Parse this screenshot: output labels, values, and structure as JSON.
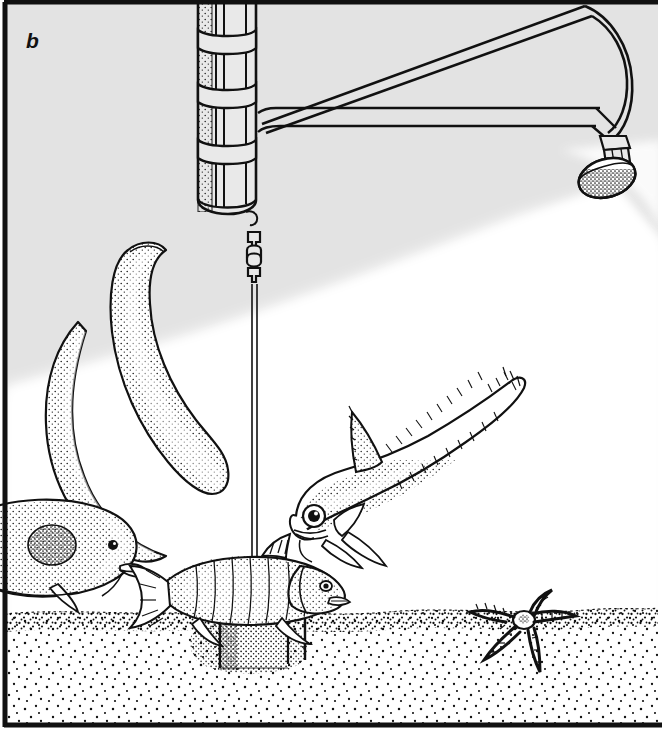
{
  "figure": {
    "panel_label": "b",
    "caption_visible": false,
    "scene_title": "Baited deep-sea camera lander on the seafloor",
    "border_color": "#000000",
    "water_color": "#e3e3e3",
    "lit_color": "#ffffff",
    "ink_color": "#000000",
    "sediment_color": "#ffffff",
    "width": 662,
    "height": 729
  },
  "scene": {
    "background": {
      "name": "water-column",
      "unlit_tone": "#e3e3e3",
      "lit_tone": "#ffffff",
      "light_cone_origin_x": 612,
      "light_cone_origin_y": 190
    },
    "sediment": {
      "name": "seafloor-sediment",
      "surface_y": 612,
      "stipple_density": "sparse",
      "surface_band_density": "dense"
    }
  },
  "equipment": {
    "buoyancy_cylinder": {
      "label": "buoyancy float cylinder",
      "x": 196,
      "y": 0,
      "width": 62,
      "height": 212,
      "band_count": 3,
      "strap_count": 3
    },
    "boom_arm": {
      "label": "lamp boom arm",
      "from_x": 258,
      "from_y": 118,
      "to_x": 600,
      "to_y": 118,
      "diagonal_to_x": 585,
      "diagonal_to_y": 105
    },
    "lamp_head": {
      "label": "underwater lamp head",
      "cx": 607,
      "cy": 178,
      "rx": 29,
      "ry": 19,
      "neck_height": 16
    },
    "swivel_shackle": {
      "label": "swivel shackle",
      "x": 248,
      "y": 228,
      "link_count": 2
    },
    "mooring_line": {
      "label": "mooring line",
      "top_y": 285,
      "bottom_y": 596,
      "x": 254
    },
    "bait_rod": {
      "label": "bait support rod",
      "x": 254,
      "top_y": 560,
      "bottom_y": 665
    },
    "ballast_weight": {
      "label": "ballast weight block",
      "x": 218,
      "y": 612,
      "width": 72,
      "height": 58
    },
    "stake_left": {
      "label": "anchor stake left",
      "x": 275,
      "top_y": 614,
      "bottom_y": 668
    },
    "stake_right": {
      "label": "anchor stake right",
      "x": 305,
      "top_y": 612,
      "bottom_y": 660
    }
  },
  "fauna": [
    {
      "name": "hagfish-left",
      "common_name": "hagfish",
      "count": 1,
      "position": "left of centre, upper water column",
      "shading": "stippled"
    },
    {
      "name": "hagfish-centre",
      "common_name": "hagfish",
      "count": 1,
      "position": "centre-left, sinuous S-curve",
      "shading": "stippled"
    },
    {
      "name": "morid-cod",
      "common_name": "deep-sea cod",
      "count": 1,
      "position": "lower left, partially out of frame",
      "shading": "stippled"
    },
    {
      "name": "grenadier-rattail",
      "common_name": "grenadier (rattail)",
      "count": 1,
      "position": "right of centre, head down toward bait",
      "shading": "stippled, fin rays hatched"
    },
    {
      "name": "bait-fish",
      "common_name": "bait fish",
      "count": 1,
      "position": "impaled on bait rod above ballast weight",
      "shading": "stippled with scale rows"
    },
    {
      "name": "brittle-star",
      "common_name": "brittle star (ophiuroid)",
      "count": 1,
      "position": "on sediment, lower right",
      "arm_count": 5
    }
  ]
}
